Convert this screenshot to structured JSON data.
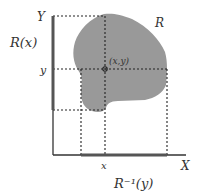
{
  "diagram": {
    "region_label": "R",
    "point_label": "(x,y)",
    "y_axis_label": "Y",
    "x_axis_label": "X",
    "y_tick_label": "y",
    "x_tick_label": "x",
    "section_y_label": "R(x)",
    "section_x_label": "R⁻¹(y)",
    "colors": {
      "region_fill": "#999999",
      "axis": "#333333",
      "highlight_segment": "#555555",
      "dotted": "#222222"
    }
  }
}
